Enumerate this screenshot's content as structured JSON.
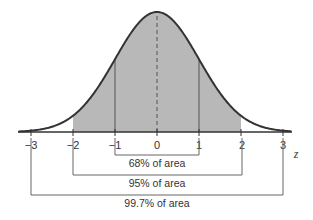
{
  "chart_data": {
    "type": "area",
    "title": "",
    "xlabel": "z",
    "ylabel": "",
    "curve": "standard normal density",
    "x_ticks": [
      -3,
      -2,
      -1,
      0,
      1,
      2,
      3
    ],
    "tick_labels": [
      "−3",
      "−2",
      "−1",
      "0",
      "1",
      "2",
      "3"
    ],
    "shaded_region": [
      -2,
      2
    ],
    "vertical_lines": [
      -1,
      0,
      1
    ],
    "brackets": [
      {
        "from": -1,
        "to": 1,
        "label": "68% of area",
        "percent": 68
      },
      {
        "from": -2,
        "to": 2,
        "label": "95% of area",
        "percent": 95
      },
      {
        "from": -3,
        "to": 3,
        "label": "99.7% of area",
        "percent": 99.7
      }
    ],
    "colors": {
      "shade": "#b8b8b8",
      "curve": "#333333",
      "lines": "#555555"
    },
    "grid": false,
    "legend": "none"
  },
  "axis": {
    "z_label": "z",
    "ticks": [
      "−3",
      "−2",
      "−1",
      "0",
      "1",
      "2",
      "3"
    ]
  },
  "brackets": {
    "b68": "68% of area",
    "b95": "95% of area",
    "b997": "99.7% of area"
  }
}
